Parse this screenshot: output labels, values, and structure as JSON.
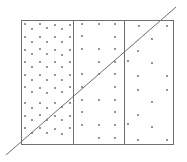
{
  "canvas": {
    "width": 187,
    "height": 162,
    "background": "#ffffff"
  },
  "colors": {
    "stroke": "#6e6e6e",
    "dot": "#6a6a6a"
  },
  "frame": {
    "x": 21,
    "y": 20,
    "width": 152,
    "height": 124,
    "stroke_width": 1
  },
  "dividers": [
    {
      "x": 73,
      "y1": 20,
      "y2": 144
    },
    {
      "x": 124,
      "y1": 20,
      "y2": 144
    }
  ],
  "diagonal_line": {
    "x1": 6,
    "y1": 155,
    "x2": 176,
    "y2": 7,
    "stroke_width": 1
  },
  "sections": [
    {
      "name": "left",
      "density": "high",
      "dot_radius": 0.95,
      "dots": [
        [
          25,
          24
        ],
        [
          40,
          24
        ],
        [
          55,
          25
        ],
        [
          62,
          29
        ],
        [
          70,
          25
        ],
        [
          32,
          29
        ],
        [
          47,
          28
        ],
        [
          25,
          37
        ],
        [
          40,
          37
        ],
        [
          55,
          37
        ],
        [
          70,
          37
        ],
        [
          32,
          42
        ],
        [
          47,
          42
        ],
        [
          62,
          42
        ],
        [
          25,
          50
        ],
        [
          40,
          49
        ],
        [
          55,
          50
        ],
        [
          70,
          50
        ],
        [
          32,
          54
        ],
        [
          47,
          54
        ],
        [
          62,
          55
        ],
        [
          25,
          62
        ],
        [
          40,
          62
        ],
        [
          55,
          62
        ],
        [
          70,
          62
        ],
        [
          32,
          67
        ],
        [
          47,
          67
        ],
        [
          62,
          67
        ],
        [
          25,
          75
        ],
        [
          40,
          75
        ],
        [
          55,
          75
        ],
        [
          70,
          75
        ],
        [
          32,
          80
        ],
        [
          47,
          80
        ],
        [
          62,
          80
        ],
        [
          25,
          87
        ],
        [
          40,
          88
        ],
        [
          55,
          88
        ],
        [
          70,
          87
        ],
        [
          32,
          92
        ],
        [
          47,
          93
        ],
        [
          62,
          92
        ],
        [
          25,
          103
        ],
        [
          40,
          103
        ],
        [
          55,
          103
        ],
        [
          70,
          103
        ],
        [
          32,
          108
        ],
        [
          47,
          108
        ],
        [
          62,
          107
        ],
        [
          25,
          116
        ],
        [
          40,
          115
        ],
        [
          55,
          116
        ],
        [
          70,
          116
        ],
        [
          32,
          120
        ],
        [
          47,
          120
        ],
        [
          62,
          120
        ],
        [
          25,
          128
        ],
        [
          40,
          128
        ],
        [
          55,
          129
        ],
        [
          70,
          128
        ],
        [
          32,
          133
        ],
        [
          47,
          133
        ],
        [
          62,
          134
        ]
      ]
    },
    {
      "name": "middle",
      "density": "medium",
      "dot_radius": 0.95,
      "dots": [
        [
          82,
          24
        ],
        [
          99,
          24
        ],
        [
          115,
          24
        ],
        [
          82,
          36
        ],
        [
          115,
          37
        ],
        [
          82,
          49
        ],
        [
          99,
          49
        ],
        [
          115,
          49
        ],
        [
          99,
          62
        ],
        [
          115,
          62
        ],
        [
          82,
          74
        ],
        [
          99,
          74
        ],
        [
          115,
          74
        ],
        [
          82,
          87
        ],
        [
          115,
          87
        ],
        [
          82,
          100
        ],
        [
          99,
          100
        ],
        [
          115,
          100
        ],
        [
          82,
          112
        ],
        [
          115,
          112
        ],
        [
          82,
          125
        ],
        [
          99,
          125
        ],
        [
          115,
          125
        ],
        [
          99,
          138
        ],
        [
          115,
          138
        ]
      ]
    },
    {
      "name": "right",
      "density": "low",
      "dot_radius": 0.95,
      "dots": [
        [
          139,
          26
        ],
        [
          167,
          26
        ],
        [
          152,
          39
        ],
        [
          138,
          51
        ],
        [
          128,
          61
        ],
        [
          152,
          63
        ],
        [
          138,
          76
        ],
        [
          167,
          76
        ],
        [
          138,
          90
        ],
        [
          167,
          90
        ],
        [
          152,
          102
        ],
        [
          138,
          115
        ],
        [
          128,
          124
        ],
        [
          152,
          127
        ],
        [
          138,
          140
        ],
        [
          167,
          140
        ]
      ]
    }
  ]
}
